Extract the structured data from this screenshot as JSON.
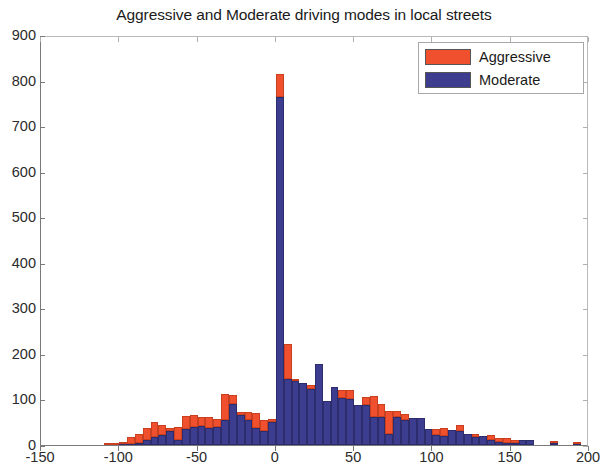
{
  "chart_data": {
    "type": "bar",
    "title": "Aggressive and Moderate driving modes in local streets",
    "xlabel": "",
    "ylabel": "",
    "xlim": [
      -150,
      200
    ],
    "ylim": [
      0,
      900
    ],
    "xticks": [
      -150,
      -100,
      -50,
      0,
      50,
      100,
      150,
      200
    ],
    "xtick_labels": [
      "-150",
      "-100",
      "-50",
      "0",
      "50",
      "100",
      "150",
      "200"
    ],
    "yticks": [
      0,
      100,
      200,
      300,
      400,
      500,
      600,
      700,
      800,
      900
    ],
    "ytick_labels": [
      "0",
      "100",
      "200",
      "300",
      "400",
      "500",
      "600",
      "700",
      "800",
      "900"
    ],
    "grid": false,
    "stacked": true,
    "bin_width": 5,
    "legend_position": "top-right",
    "legend": [
      "Aggressive",
      "Moderate"
    ],
    "colors": {
      "aggressive": "#f1502f",
      "moderate": "#3d3d8f",
      "axis": "#7a7a7a",
      "text": "#2b2b2b",
      "background": "#ffffff"
    },
    "x": [
      -110,
      -105,
      -100,
      -95,
      -90,
      -85,
      -80,
      -75,
      -70,
      -65,
      -60,
      -55,
      -50,
      -45,
      -40,
      -35,
      -30,
      -25,
      -20,
      -15,
      -10,
      -5,
      0,
      5,
      10,
      15,
      20,
      25,
      30,
      35,
      40,
      45,
      50,
      55,
      60,
      65,
      70,
      75,
      80,
      85,
      90,
      95,
      100,
      105,
      110,
      115,
      120,
      125,
      130,
      135,
      140,
      145,
      150,
      155,
      160,
      165,
      170,
      175,
      180,
      185,
      190
    ],
    "series": [
      {
        "name": "Moderate",
        "values": [
          0,
          0,
          2,
          3,
          5,
          12,
          18,
          22,
          30,
          10,
          35,
          40,
          42,
          38,
          40,
          56,
          90,
          65,
          55,
          38,
          30,
          50,
          765,
          145,
          140,
          137,
          122,
          178,
          96,
          128,
          104,
          100,
          88,
          88,
          62,
          62,
          25,
          62,
          56,
          60,
          60,
          35,
          22,
          20,
          33,
          30,
          25,
          18,
          20,
          12,
          6,
          5,
          5,
          10,
          10,
          0,
          0,
          5,
          0,
          0,
          3
        ]
      },
      {
        "name": "Aggressive",
        "values": [
          3,
          2,
          5,
          14,
          20,
          26,
          33,
          23,
          7,
          30,
          28,
          25,
          20,
          23,
          18,
          55,
          20,
          8,
          18,
          32,
          26,
          8,
          50,
          77,
          6,
          0,
          10,
          0,
          0,
          0,
          16,
          20,
          0,
          18,
          45,
          28,
          50,
          12,
          13,
          0,
          0,
          0,
          13,
          17,
          0,
          14,
          0,
          6,
          0,
          10,
          10,
          10,
          7,
          0,
          0,
          0,
          0,
          3,
          0,
          0,
          2
        ]
      }
    ]
  },
  "legend": {
    "items": [
      {
        "label": "Aggressive",
        "color": "#f1502f"
      },
      {
        "label": "Moderate",
        "color": "#3d3d8f"
      }
    ]
  },
  "title": "Aggressive and Moderate driving modes in local streets"
}
